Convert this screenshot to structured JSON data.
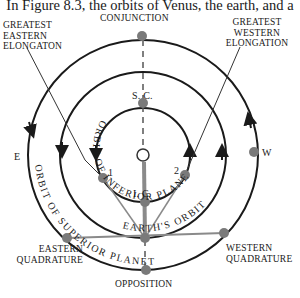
{
  "caption": "In Figure 8.3, the orbits of Venus, the earth, and a",
  "labels": {
    "conjunction": "CONJUNCTION",
    "greatest_eastern": [
      "GREATEST",
      "EASTERN",
      "ELONGATON"
    ],
    "greatest_western": [
      "GREATEST",
      "WESTERN",
      "ELONGATION"
    ],
    "east": "E",
    "west": "W",
    "superior_conjunction": "S. C.",
    "inferior_conjunction": "I. C.",
    "point_1": "1",
    "point_2": "2",
    "sun_symbol": "S",
    "eastern_quadrature": [
      "EASTERN",
      "QUADRATURE"
    ],
    "western_quadrature": [
      "WESTERN",
      "QUADRATURE"
    ],
    "opposition": "OPPOSITION"
  },
  "orbit_labels": {
    "inferior": "ORBIT OF INFERIOR PLANET",
    "earth": "EARTH'S ORBIT",
    "superior": "ORBIT OF SUPERIOR PLANET"
  },
  "colors": {
    "orbit": "#1a1a1a",
    "dot": "#7a7a7a",
    "line": "#8a8a8a"
  }
}
